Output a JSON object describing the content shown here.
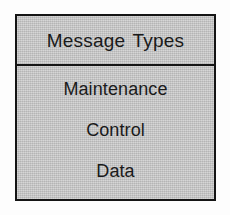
{
  "figure": {
    "kind": "table",
    "background_color": "#fdfdfd",
    "box_fill_color": "#c7c7c7",
    "border_color": "#151515",
    "text_color": "#1a1a1a"
  },
  "table": {
    "header": {
      "label": "Message Types"
    },
    "rows": [
      {
        "label": "Maintenance"
      },
      {
        "label": "Control"
      },
      {
        "label": "Data"
      }
    ]
  }
}
